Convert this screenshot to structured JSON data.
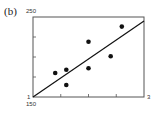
{
  "panel": {
    "label": "(b)"
  },
  "chart_data": {
    "type": "scatter",
    "title": "",
    "xlabel": "",
    "ylabel": "",
    "xlim": [
      1,
      3
    ],
    "ylim": [
      150,
      250
    ],
    "x_tick_labels": [
      "1",
      "3"
    ],
    "y_tick_labels": [
      "150",
      "250"
    ],
    "x_minor_ticks": [
      1.5,
      2.0,
      2.5
    ],
    "y_minor_ticks": [
      175,
      200,
      225
    ],
    "grid": false,
    "legend": null,
    "points": [
      {
        "x": 1.4,
        "y": 180
      },
      {
        "x": 1.6,
        "y": 184
      },
      {
        "x": 1.6,
        "y": 165
      },
      {
        "x": 2.0,
        "y": 186
      },
      {
        "x": 2.0,
        "y": 219
      },
      {
        "x": 2.4,
        "y": 201
      },
      {
        "x": 2.6,
        "y": 238
      }
    ],
    "fit_line": {
      "x": [
        1,
        3
      ],
      "y": [
        150,
        245
      ]
    },
    "colors": {
      "points": "#111111",
      "line": "#111111",
      "frame": "#555555"
    }
  }
}
